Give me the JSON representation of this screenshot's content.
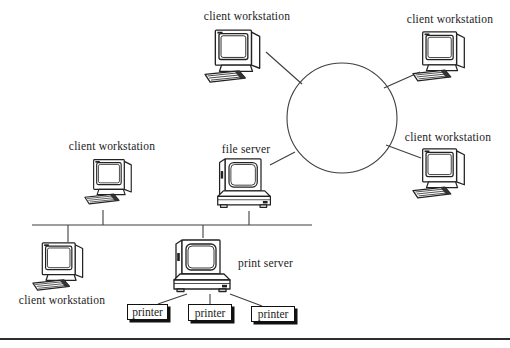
{
  "diagram_title": "local area network diagram",
  "nodes": {
    "ws_top": {
      "label": "client workstation",
      "type": "workstation"
    },
    "ws_top_right": {
      "label": "client workstation",
      "type": "workstation"
    },
    "ws_mid_right": {
      "label": "client workstation",
      "type": "workstation"
    },
    "ws_mid_left": {
      "label": "client workstation",
      "type": "workstation"
    },
    "ws_bottom_left": {
      "label": "client workstation",
      "type": "workstation"
    },
    "file_server": {
      "label": "file server",
      "type": "server"
    },
    "print_server": {
      "label": "print server",
      "type": "server"
    },
    "printer_1": {
      "label": "printer",
      "type": "printer"
    },
    "printer_2": {
      "label": "printer",
      "type": "printer"
    },
    "printer_3": {
      "label": "printer",
      "type": "printer"
    }
  },
  "topology": {
    "ring": "circle hub connecting ws_top, ws_top_right, ws_mid_right, file_server",
    "bus": "horizontal segment connecting file_server, ws_mid_left, ws_bottom_left, print_server",
    "print_fanout": "print_server to printer_1, printer_2, printer_3"
  },
  "colors": {
    "ink": "#1c1c1c",
    "line": "#3f3f3f",
    "shadow": "#111111",
    "background": "#ffffff"
  }
}
